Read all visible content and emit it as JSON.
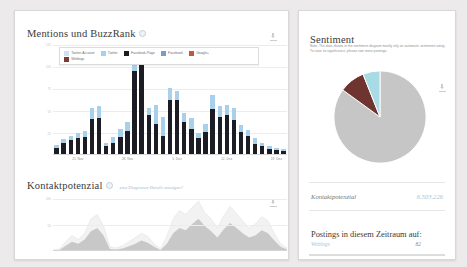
{
  "left_panel": {
    "title": "Mentions und BuzzRank",
    "info_icon": "info-circle-icon",
    "download_icon": "download-icon",
    "legend": [
      {
        "label": "Twitter-Account",
        "color": "#cfe2f2"
      },
      {
        "label": "Twitter",
        "color": "#a8d0ea"
      },
      {
        "label": "Facebook-Page",
        "color": "#1c1c24"
      },
      {
        "label": "Facebook",
        "color": "#7d9dc0"
      },
      {
        "label": "Google+",
        "color": "#c6553a"
      },
      {
        "label": "Weblogs",
        "color": "#7a3a36"
      }
    ],
    "kontakt_title": "Kontaktpotenzial",
    "kontakt_link": "eine Diagramm-Details anzeigen?",
    "kontakt_info_icon": "info-circle-icon"
  },
  "right_panel": {
    "title": "Sentiment",
    "note": "Note: The data shown in the sentiment diagram mostly rely on automatic sentiment rating. To raise its significance, please rate more postings.",
    "download_icon": "download-icon",
    "kontakt_label": "Kontaktpotenzial",
    "kontakt_value": "6.503.226",
    "postings_title": "Postings in diesem Zeitraum auf:",
    "postings": [
      {
        "name": "Weblogs",
        "count": "82"
      }
    ]
  },
  "chart_data": [
    {
      "type": "bar",
      "title": "Mentions und BuzzRank",
      "stacked": true,
      "xlabel": "",
      "ylabel": "",
      "ylim": [
        0,
        125
      ],
      "yticks": [
        "125",
        "100",
        "75",
        "50",
        "25"
      ],
      "grid": true,
      "legend_position": "top",
      "categories": [
        "18. Nov",
        "19. Nov",
        "20. Nov",
        "21. Nov",
        "22. Nov",
        "23. Nov",
        "24. Nov",
        "25. Nov",
        "26. Nov",
        "27. Nov",
        "28. Nov",
        "29. Nov",
        "30. Nov",
        "1. Dez",
        "2. Dez",
        "3. Dez",
        "4. Dez",
        "5. Dez",
        "6. Dez",
        "7. Dez",
        "8. Dez",
        "9. Dez",
        "10. Dez",
        "11. Dez",
        "12. Dez",
        "13. Dez",
        "14. Dez",
        "15. Dez",
        "16. Dez",
        "17. Dez",
        "18. Dez",
        "19. Dez",
        "20. Dez"
      ],
      "tick_labels": [
        {
          "index": 3,
          "label": "21. Nov"
        },
        {
          "index": 10,
          "label": "28. Nov"
        },
        {
          "index": 17,
          "label": "5. Dez"
        },
        {
          "index": 24,
          "label": "12. Dez"
        },
        {
          "index": 31,
          "label": "19. Dez"
        }
      ],
      "series": [
        {
          "name": "Facebook-Page",
          "color": "#1c1c24",
          "values": [
            8,
            14,
            17,
            19,
            20,
            41,
            42,
            10,
            14,
            20,
            27,
            96,
            118,
            45,
            35,
            22,
            62,
            62,
            38,
            30,
            19,
            26,
            52,
            43,
            46,
            40,
            26,
            22,
            12,
            10,
            7,
            6,
            5
          ]
        },
        {
          "name": "Twitter",
          "color": "#a8d0ea",
          "values": [
            3,
            4,
            5,
            6,
            7,
            12,
            14,
            4,
            7,
            10,
            10,
            8,
            4,
            9,
            22,
            21,
            14,
            11,
            10,
            12,
            6,
            9,
            16,
            13,
            11,
            14,
            8,
            6,
            7,
            4,
            3,
            2,
            2
          ]
        }
      ]
    },
    {
      "type": "area",
      "title": "Kontaktpotenzial",
      "ylim": [
        0,
        100
      ],
      "yticks": [
        "100",
        "50"
      ],
      "grid": true,
      "series": [
        {
          "name": "Kontaktpotenzial gesamt",
          "color": "#f2f2f2",
          "values": [
            2,
            4,
            18,
            30,
            22,
            34,
            62,
            70,
            48,
            8,
            6,
            10,
            18,
            26,
            34,
            28,
            14,
            4,
            28,
            62,
            78,
            70,
            84,
            96,
            74,
            62,
            44,
            68,
            86,
            72,
            58,
            44,
            52,
            66,
            58,
            34,
            14,
            6
          ]
        },
        {
          "name": "Kontaktpotenzial Weblogs",
          "color": "#c8c8c8",
          "values": [
            1,
            2,
            10,
            18,
            14,
            22,
            38,
            44,
            30,
            4,
            3,
            5,
            9,
            14,
            20,
            16,
            8,
            2,
            14,
            34,
            44,
            40,
            52,
            62,
            48,
            38,
            26,
            42,
            54,
            44,
            34,
            26,
            30,
            40,
            34,
            20,
            8,
            3
          ]
        }
      ]
    },
    {
      "type": "pie",
      "title": "Sentiment",
      "labels": [
        "neutral",
        "negativ",
        "positiv"
      ],
      "values": [
        85,
        9,
        6
      ],
      "colors": [
        "#c6c6c6",
        "#6f3330",
        "#a8dbe4"
      ]
    }
  ]
}
